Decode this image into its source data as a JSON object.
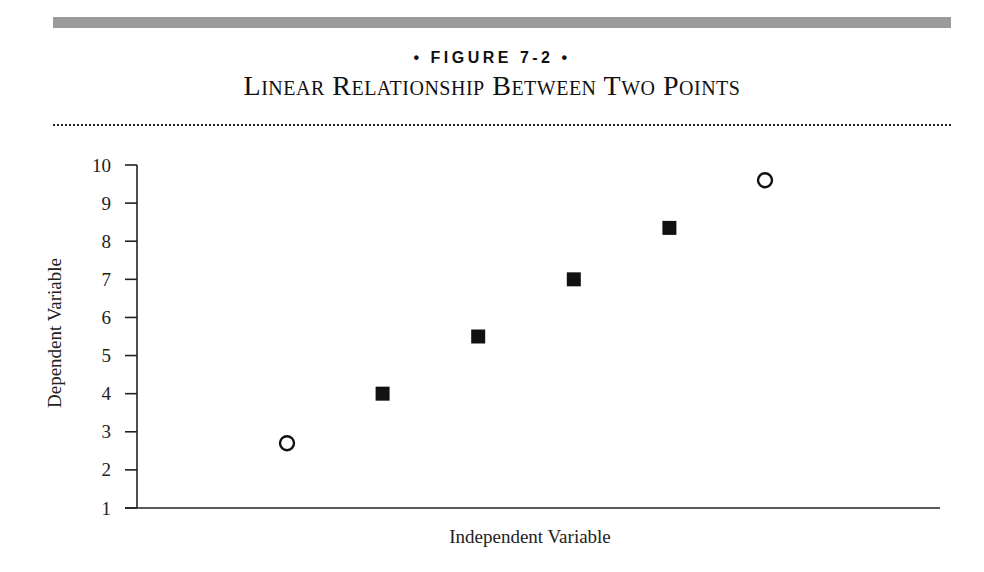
{
  "figure": {
    "label": "• FIGURE 7-2 •",
    "title": "Linear Relationship Between Two Points"
  },
  "chart_data": {
    "type": "scatter",
    "title": "Linear Relationship Between Two Points",
    "figure_label": "FIGURE 7-2",
    "xlabel": "Independent Variable",
    "ylabel": "Dependent Variable",
    "ylim": [
      1,
      10
    ],
    "yticks": [
      1,
      2,
      3,
      4,
      5,
      6,
      7,
      8,
      9,
      10
    ],
    "xticks": [],
    "grid": false,
    "legend": null,
    "series": [
      {
        "name": "Known points",
        "marker": "open-circle",
        "x": [
          1,
          6
        ],
        "y": [
          2.7,
          9.6
        ]
      },
      {
        "name": "Interpolated points",
        "marker": "filled-square",
        "x": [
          2,
          3,
          4,
          5
        ],
        "y": [
          4.0,
          5.5,
          7.0,
          8.35
        ]
      }
    ]
  },
  "colors": {
    "top_bar": "#9b9b9b",
    "ink": "#111111"
  }
}
